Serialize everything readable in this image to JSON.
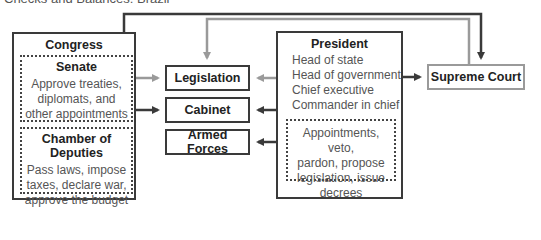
{
  "header": {
    "title_partial": "Checks and Balances: Brazil"
  },
  "congress": {
    "title": "Congress",
    "senate": {
      "title": "Senate",
      "lines": [
        "Approve treaties,",
        "diplomats, and",
        "other appointments"
      ]
    },
    "chamber": {
      "title": "Chamber of Deputies",
      "lines": [
        "Pass laws, impose",
        "taxes, declare war,",
        "approve the budget"
      ]
    }
  },
  "middle_nodes": {
    "legislation": "Legislation",
    "cabinet": "Cabinet",
    "armed_forces": "Armed Forces"
  },
  "president": {
    "title": "President",
    "roles": [
      "Head of state",
      "Head of government",
      "Chief executive",
      "Commander in chief"
    ],
    "powers": [
      "Appointments, veto,",
      "pardon, propose",
      "legislation, issue",
      "decrees"
    ]
  },
  "supreme_court": {
    "title": "Supreme Court"
  },
  "colors": {
    "dark_line": "#3a3a3a",
    "light_line": "#9a9a9a"
  }
}
